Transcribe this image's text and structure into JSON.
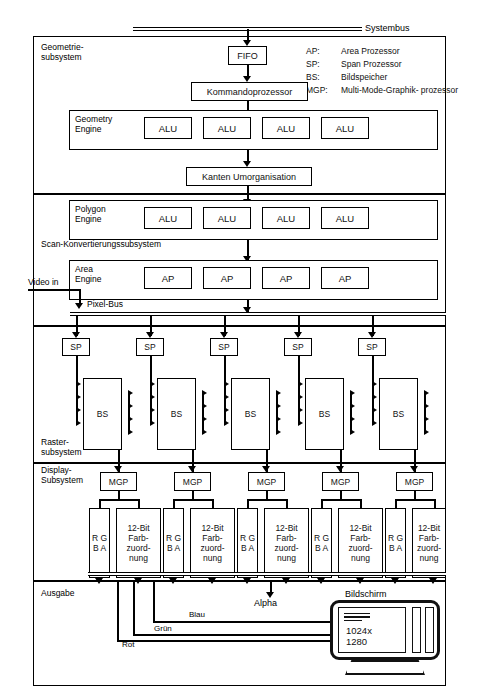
{
  "diagram": {
    "bus_label": "Systembus",
    "legend": [
      {
        "key": "AP:",
        "value": "Area Prozessor"
      },
      {
        "key": "SP:",
        "value": "Span Prozessor"
      },
      {
        "key": "BS:",
        "value": "Bildspeicher"
      },
      {
        "key": "MGP:",
        "value": "Multi-Mode-Graphik-\nprozessor"
      }
    ],
    "sections": [
      {
        "id": "geometrie",
        "label": "Geometrie-\nsubsystem"
      },
      {
        "id": "scan",
        "label": "Scan-Konvertierungssubsystem"
      },
      {
        "id": "raster",
        "label": "Raster-\nsubsystem"
      },
      {
        "id": "display",
        "label": "Display-\nSubsystem"
      },
      {
        "id": "ausgabe",
        "label": "Ausgabe"
      }
    ],
    "fifo": "FIFO",
    "kommandoprozessor": "Kommandoprozessor",
    "kanten": "Kanten Umorganisation",
    "geometry_engine": {
      "label": "Geometry\nEngine",
      "units": [
        "ALU",
        "ALU",
        "ALU",
        "ALU"
      ]
    },
    "polygon_engine": {
      "label": "Polygon\nEngine",
      "units": [
        "ALU",
        "ALU",
        "ALU",
        "ALU"
      ]
    },
    "area_engine": {
      "label": "Area\nEngine",
      "units": [
        "AP",
        "AP",
        "AP",
        "AP"
      ]
    },
    "video_in": "Video in",
    "pixel_bus": "Pixel-Bus",
    "span_processors": [
      "SP",
      "SP",
      "SP",
      "SP",
      "SP"
    ],
    "frame_buffers": [
      "BS",
      "BS",
      "BS",
      "BS",
      "BS"
    ],
    "mgps": [
      "MGP",
      "MGP",
      "MGP",
      "MGP",
      "MGP"
    ],
    "rgba_label": "R\nG\nB\nA",
    "colormap_label": "12-Bit\nFarb-\nzuord-\nnung",
    "rgba_columns": [
      "R\nG\nB\nA",
      "R\nG\nB\nA",
      "R\nG\nB\nA",
      "R\nG\nB\nA",
      "R\nG\nB\nA"
    ],
    "colormap_columns": [
      "12-Bit\nFarb-\nzuord-\nnung",
      "12-Bit\nFarb-\nzuord-\nnung",
      "12-Bit\nFarb-\nzuord-\nnung",
      "12-Bit\nFarb-\nzuord-\nnung",
      "12-Bit\nFarb-\nzuord-\nnung"
    ],
    "output_signals": {
      "alpha": "Alpha",
      "blau": "Blau",
      "gruen": "Grün",
      "rot": "Rot"
    },
    "monitor": {
      "caption": "Bildschirm",
      "resolution": "1024x\n1280"
    }
  }
}
